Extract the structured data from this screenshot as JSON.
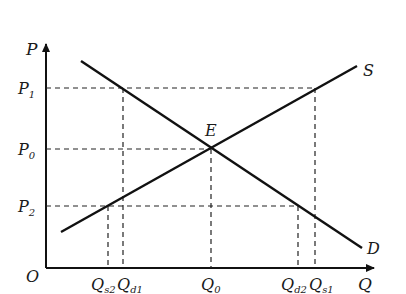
{
  "diagram": {
    "type": "supply-demand",
    "axes": {
      "y_label": "P",
      "x_label": "Q",
      "origin_label": "O"
    },
    "curves": {
      "supply": {
        "label": "S"
      },
      "demand": {
        "label": "D"
      }
    },
    "equilibrium": {
      "label": "E"
    },
    "price_levels": [
      {
        "main": "P",
        "sub": "1"
      },
      {
        "main": "P",
        "sub": "0"
      },
      {
        "main": "P",
        "sub": "2"
      }
    ],
    "quantity_levels": [
      {
        "main": "Q",
        "sub": "s2"
      },
      {
        "main": "Q",
        "sub": "d1"
      },
      {
        "main": "Q",
        "sub": "0"
      },
      {
        "main": "Q",
        "sub": "d2"
      },
      {
        "main": "Q",
        "sub": "s1"
      }
    ],
    "colors": {
      "line": "#111111",
      "dash": "#222222",
      "background": "#ffffff"
    }
  }
}
